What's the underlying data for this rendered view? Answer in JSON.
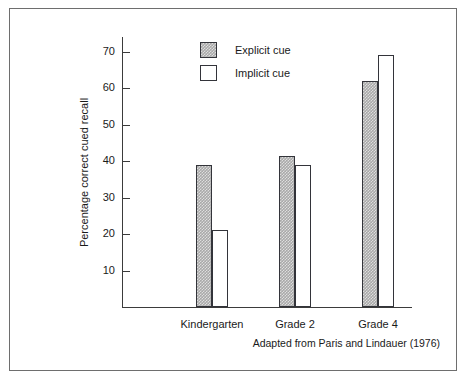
{
  "figure": {
    "source_note": "Adapted from Paris and Lindauer (1976)",
    "border_color": "#6e6e6e"
  },
  "chart_data": {
    "type": "bar",
    "title": "",
    "subtitle": "",
    "xlabel": "",
    "ylabel": "Percentage correct cued recall",
    "categories": [
      "Kindergarten",
      "Grade 2",
      "Grade 4"
    ],
    "series": [
      {
        "name": "Explicit cue",
        "values": [
          39,
          41.5,
          62
        ],
        "fill": "#a9a9a9",
        "pattern": "dither-gray",
        "border": "#33343a"
      },
      {
        "name": "Implicit cue",
        "values": [
          21,
          39,
          69
        ],
        "fill": "#ffffff",
        "pattern": "none",
        "border": "#33343a"
      }
    ],
    "ylim": [
      0,
      74
    ],
    "yticks": [
      10,
      20,
      30,
      40,
      50,
      60,
      70
    ],
    "ytick_labels": [
      "10",
      "20",
      "30",
      "40",
      "50",
      "60",
      "70"
    ],
    "grid": false,
    "legend_position": "top-center",
    "tick_direction": "in-right",
    "axis_color": "#3b3b3b"
  }
}
